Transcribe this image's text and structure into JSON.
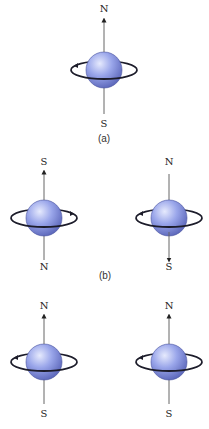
{
  "figure": {
    "colors": {
      "sphere_light": "#dfe4fb",
      "sphere_mid": "#8e9be6",
      "sphere_dark": "#5662b8",
      "axis": "#555555",
      "ring": "#1c1c2a",
      "text": "#222222"
    },
    "panels": [
      {
        "id": "a",
        "caption": "(a)",
        "spins": [
          {
            "cx": 104,
            "cy": 70,
            "top_label": "N",
            "bottom_label": "S",
            "axis_arrow": "up",
            "rotation_arrow_side": "left"
          }
        ]
      },
      {
        "id": "b",
        "caption": "(b)",
        "spins": [
          {
            "cx": 44,
            "cy": 218,
            "top_label": "S",
            "bottom_label": "N",
            "axis_arrow": "up",
            "rotation_arrow_side": "right"
          },
          {
            "cx": 169,
            "cy": 218,
            "top_label": "N",
            "bottom_label": "S",
            "axis_arrow": "down",
            "rotation_arrow_side": "left"
          }
        ]
      },
      {
        "id": "c",
        "caption": "",
        "spins": [
          {
            "cx": 44,
            "cy": 362,
            "top_label": "N",
            "bottom_label": "S",
            "axis_arrow": "up",
            "rotation_arrow_side": "left"
          },
          {
            "cx": 169,
            "cy": 362,
            "top_label": "N",
            "bottom_label": "S",
            "axis_arrow": "up",
            "rotation_arrow_side": "left"
          }
        ]
      }
    ]
  }
}
